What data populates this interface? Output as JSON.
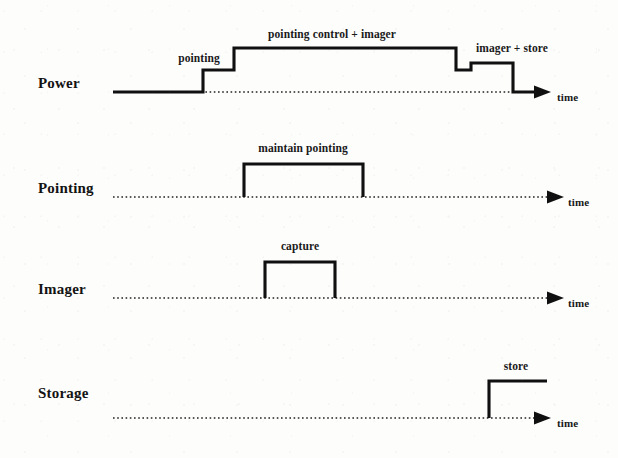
{
  "figure": {
    "type": "timing-diagram",
    "background_color": "#fdfdfc",
    "line_color": "#101010",
    "baseline_style": "dotted",
    "axis_label": "time",
    "width": 618,
    "height": 458
  },
  "rows": [
    {
      "label": "Power",
      "label_x": 38,
      "label_y": 88,
      "baseline_y": 92,
      "axis_start_x": 113,
      "axis_end_x": 538,
      "arrow_tip_x": 551,
      "time_label_x": 557,
      "time_label_y": 101,
      "levels": {
        "base": 92,
        "low": 70,
        "mid": 63,
        "high": 48
      },
      "waveform_points": "113,92 203,92 203,70 234,70 234,48 456,48 456,70 471,70 471,63 513,63 513,92 538,92",
      "segments": [
        {
          "label": "pointing",
          "cx": 199,
          "cy": 62
        },
        {
          "label": "pointing control + imager",
          "cx": 332,
          "cy": 38
        },
        {
          "label": "imager + store",
          "cx": 512,
          "cy": 52
        }
      ]
    },
    {
      "label": "Pointing",
      "label_x": 38,
      "label_y": 193,
      "baseline_y": 197,
      "axis_start_x": 113,
      "axis_end_x": 551,
      "arrow_tip_x": 564,
      "time_label_x": 568,
      "time_label_y": 206,
      "levels": {
        "base": 197,
        "high": 164
      },
      "waveform_points": "244,197 244,164 363,164 363,197",
      "segments": [
        {
          "label": "maintain pointing",
          "cx": 303,
          "cy": 152
        }
      ]
    },
    {
      "label": "Imager",
      "label_x": 38,
      "label_y": 294,
      "baseline_y": 298,
      "axis_start_x": 113,
      "axis_end_x": 551,
      "arrow_tip_x": 564,
      "time_label_x": 568,
      "time_label_y": 307,
      "levels": {
        "base": 298,
        "high": 262
      },
      "waveform_points": "265,298 265,262 335,262 335,298",
      "segments": [
        {
          "label": "capture",
          "cx": 300,
          "cy": 250
        }
      ]
    },
    {
      "label": "Storage",
      "label_x": 38,
      "label_y": 398,
      "baseline_y": 418,
      "axis_start_x": 113,
      "axis_end_x": 538,
      "arrow_tip_x": 551,
      "time_label_x": 557,
      "time_label_y": 427,
      "levels": {
        "base": 418,
        "high": 381
      },
      "waveform_points": "489,418 489,381 547,381",
      "segments": [
        {
          "label": "store",
          "cx": 516,
          "cy": 370
        }
      ]
    }
  ],
  "chart_data": {
    "type": "line",
    "title": "",
    "xlabel": "time",
    "ylabel": "",
    "series": [
      {
        "name": "Power",
        "annotations": [
          "pointing",
          "pointing control + imager",
          "imager + store"
        ],
        "levels": [
          0,
          0,
          1,
          1,
          2,
          2,
          1,
          1,
          1.5,
          1.5,
          0,
          0
        ],
        "x": [
          113,
          203,
          203,
          234,
          234,
          456,
          456,
          471,
          471,
          513,
          513,
          538
        ]
      },
      {
        "name": "Pointing",
        "annotations": [
          "maintain pointing"
        ],
        "levels": [
          0,
          1,
          1,
          0
        ],
        "x": [
          244,
          244,
          363,
          363
        ]
      },
      {
        "name": "Imager",
        "annotations": [
          "capture"
        ],
        "levels": [
          0,
          1,
          1,
          0
        ],
        "x": [
          265,
          265,
          335,
          335
        ]
      },
      {
        "name": "Storage",
        "annotations": [
          "store"
        ],
        "levels": [
          0,
          1,
          1
        ],
        "x": [
          489,
          489,
          547
        ]
      }
    ]
  }
}
